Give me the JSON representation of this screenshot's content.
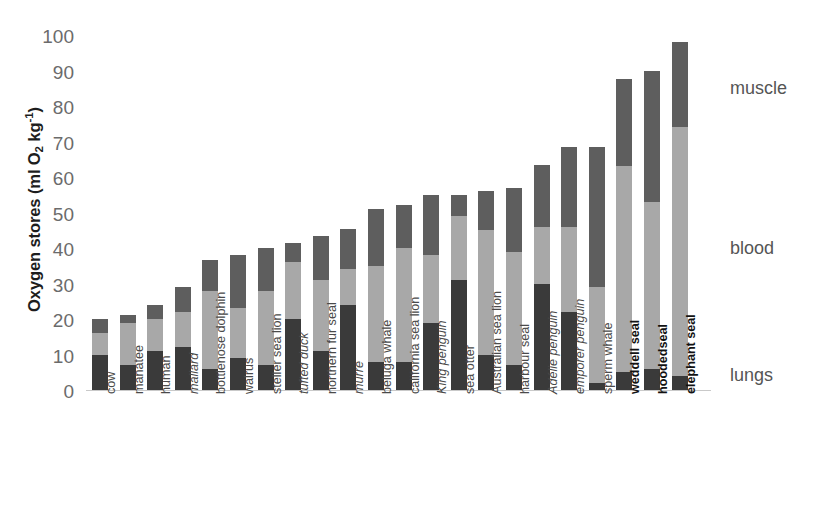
{
  "chart_data": {
    "type": "bar",
    "subtype": "stacked-vertical",
    "title": "",
    "xlabel": "",
    "ylabel": "Oxygen stores (ml O2 kg-1)",
    "ylabel_html": "Oxygen stores (ml O<sub>2</sub> kg<sup>-1</sup>)",
    "ylim": [
      0,
      100
    ],
    "yticks": [
      0,
      10,
      20,
      30,
      40,
      50,
      60,
      70,
      80,
      90,
      100
    ],
    "grid": false,
    "legend_position": "right",
    "stack_order_bottom_to_top": [
      "lungs",
      "blood",
      "muscle"
    ],
    "series": [
      {
        "name": "lungs",
        "color": "#3a3a3a",
        "values": [
          10,
          7,
          11,
          12,
          6,
          9,
          7,
          20,
          11,
          24,
          8,
          8,
          19,
          31,
          10,
          7,
          30,
          22,
          2,
          5,
          6,
          4
        ]
      },
      {
        "name": "blood",
        "color": "#a8a8a8",
        "values": [
          6,
          12,
          9,
          10,
          22,
          14,
          21,
          16,
          20,
          10,
          27,
          32,
          19,
          18,
          35,
          32,
          16,
          24,
          27,
          58,
          47,
          70
        ]
      },
      {
        "name": "muscle",
        "color": "#5e5e5e",
        "values": [
          4,
          2,
          4,
          7,
          8.5,
          15,
          12,
          5.5,
          12.5,
          11.5,
          16,
          12,
          17,
          6,
          11,
          18,
          17.5,
          22.5,
          39.5,
          24.5,
          37,
          24
        ]
      }
    ],
    "categories": [
      {
        "label": "cow",
        "style": "normal",
        "total": 20
      },
      {
        "label": "manatee",
        "style": "normal",
        "total": 21
      },
      {
        "label": "human",
        "style": "normal",
        "total": 24
      },
      {
        "label": "mallard",
        "style": "italic",
        "total": 29
      },
      {
        "label": "bottlenose dolphin",
        "style": "normal",
        "total": 36.5
      },
      {
        "label": "walrus",
        "style": "normal",
        "total": 38
      },
      {
        "label": "steller sea lion",
        "style": "normal",
        "total": 40
      },
      {
        "label": "tufted duck",
        "style": "italic",
        "total": 41.5
      },
      {
        "label": "northern fur seal",
        "style": "normal",
        "total": 43.5
      },
      {
        "label": "murre",
        "style": "italic",
        "total": 45.5
      },
      {
        "label": "beluga whale",
        "style": "normal",
        "total": 51
      },
      {
        "label": "california sea lion",
        "style": "normal",
        "total": 52
      },
      {
        "label": "King penguin",
        "style": "italic",
        "total": 55
      },
      {
        "label": "sea otter",
        "style": "normal",
        "total": 55
      },
      {
        "label": "Australian sea lion",
        "style": "normal",
        "total": 56
      },
      {
        "label": "harbour seal",
        "style": "normal",
        "total": 57
      },
      {
        "label": "Adélie penguin",
        "style": "italic",
        "total": 63.5
      },
      {
        "label": "emporer penguin",
        "style": "italic",
        "total": 68.5
      },
      {
        "label": "sperm whale",
        "style": "normal",
        "total": 68.5
      },
      {
        "label": "weddell seal",
        "style": "bold",
        "total": 87.5
      },
      {
        "label": "hoodedseal",
        "style": "bold",
        "total": 90
      },
      {
        "label": "elephant seal",
        "style": "bold",
        "total": 98
      }
    ],
    "legend": [
      {
        "label": "muscle",
        "color": "#5e5e5e",
        "y": 88
      },
      {
        "label": "blood",
        "color": "#a8a8a8",
        "y": 248
      },
      {
        "label": "lungs",
        "color": "#3a3a3a",
        "y": 375
      }
    ]
  },
  "axis": {
    "y_title_prefix": "Oxygen stores (ml O",
    "y_title_sub": "2",
    "y_title_mid": " kg",
    "y_title_sup": "-1",
    "y_title_suffix": ")"
  }
}
